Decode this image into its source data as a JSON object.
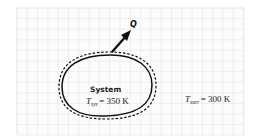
{
  "diagram": {
    "heat_label": "Q",
    "system_label": "System",
    "system_temp": {
      "symbol": "T",
      "subscript": "sys",
      "value": "= 350 K"
    },
    "surr_temp": {
      "symbol": "T",
      "subscript": "surr",
      "value": "= 300 K"
    },
    "colors": {
      "grid": "#e2e2e2",
      "stroke": "#111111"
    }
  }
}
